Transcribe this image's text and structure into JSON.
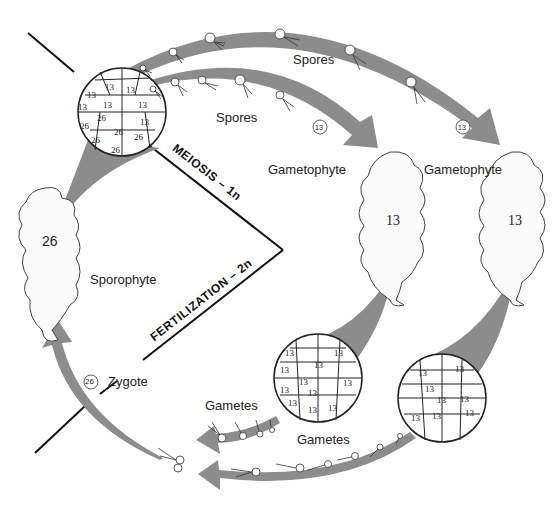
{
  "diagram": {
    "labels": {
      "spores_top": "Spores",
      "spores_inner": "Spores",
      "gametophyte_1": "Gametophyte",
      "gametophyte_2": "Gametophyte",
      "sporophyte": "Sporophyte",
      "zygote": "Zygote",
      "gametes_1": "Gametes",
      "gametes_2": "Gametes",
      "meiosis": "MEIOSIS – 1n",
      "fertilization": "FERTILIZATION – 2n"
    },
    "ploidy": {
      "sporophyte": "26",
      "gametophyte_1": "13",
      "gametophyte_2": "13",
      "zygote": "26",
      "spore": "13",
      "gamete": "13"
    },
    "sporangium_cells": {
      "haploid": [
        "13",
        "13",
        "13",
        "13",
        "13",
        "13",
        "13"
      ],
      "diploid": [
        "26",
        "26",
        "26",
        "26",
        "26",
        "26"
      ]
    },
    "gametangium_1_cells": [
      "13",
      "13",
      "13",
      "13",
      "13",
      "13",
      "13",
      "13",
      "13",
      "13",
      "13"
    ],
    "gametangium_2_cells": [
      "13",
      "13",
      "13",
      "13",
      "13",
      "13",
      "13",
      "13"
    ],
    "colors": {
      "arrow": "#8c8c8c",
      "line": "#111111",
      "text": "#222222"
    }
  }
}
